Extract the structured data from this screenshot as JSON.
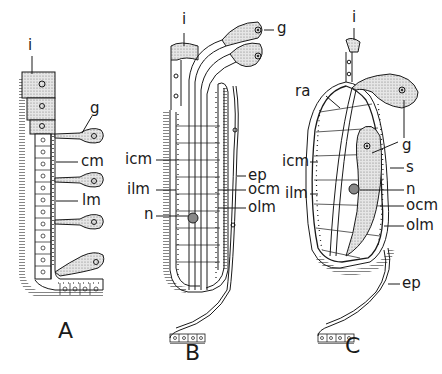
{
  "figure": {
    "panels": [
      {
        "id": "A",
        "label": "A",
        "annotations": [
          {
            "key": "i",
            "text": "i"
          },
          {
            "key": "g",
            "text": "g"
          },
          {
            "key": "cm",
            "text": "cm"
          },
          {
            "key": "lm",
            "text": "lm"
          }
        ]
      },
      {
        "id": "B",
        "label": "B",
        "annotations": [
          {
            "key": "i",
            "text": "i"
          },
          {
            "key": "g",
            "text": "g"
          },
          {
            "key": "icm",
            "text": "icm"
          },
          {
            "key": "ep",
            "text": "ep"
          },
          {
            "key": "ilm",
            "text": "ilm"
          },
          {
            "key": "ocm",
            "text": "ocm"
          },
          {
            "key": "n",
            "text": "n"
          },
          {
            "key": "olm",
            "text": "olm"
          }
        ]
      },
      {
        "id": "C",
        "label": "C",
        "annotations": [
          {
            "key": "i",
            "text": "i"
          },
          {
            "key": "ra",
            "text": "ra"
          },
          {
            "key": "g",
            "text": "g"
          },
          {
            "key": "icm",
            "text": "icm"
          },
          {
            "key": "s",
            "text": "s"
          },
          {
            "key": "n",
            "text": "n"
          },
          {
            "key": "ilm",
            "text": "ilm"
          },
          {
            "key": "ocm",
            "text": "ocm"
          },
          {
            "key": "olm",
            "text": "olm"
          },
          {
            "key": "ep",
            "text": "ep"
          }
        ]
      }
    ],
    "colors": {
      "ink": "#1a1a1a",
      "stipple": "#c8c8c8",
      "background": "#ffffff"
    }
  }
}
